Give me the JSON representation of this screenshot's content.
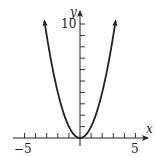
{
  "chart_data": {
    "type": "line",
    "title": "",
    "function": "y = x^2",
    "xlabel": "x",
    "ylabel": "y",
    "xlim": [
      -5.5,
      6
    ],
    "ylim": [
      -0.6,
      11
    ],
    "x_tick_step": 1,
    "y_tick_step": 1,
    "x_tick_labels": [
      {
        "value": -5,
        "label": "−5"
      },
      {
        "value": 5,
        "label": "5"
      }
    ],
    "y_tick_labels": [
      {
        "value": 10,
        "label": "10"
      }
    ],
    "grid": false,
    "legend": null,
    "series": [
      {
        "name": "y = x^2",
        "x": [
          -3.2,
          -3,
          -2.5,
          -2,
          -1.5,
          -1,
          -0.5,
          0,
          0.5,
          1,
          1.5,
          2,
          2.5,
          3,
          3.2
        ],
        "values": [
          10.24,
          9,
          6.25,
          4,
          2.25,
          1,
          0.25,
          0,
          0.25,
          1,
          2.25,
          4,
          6.25,
          9,
          10.24
        ],
        "arrows_at_ends": true
      }
    ],
    "color": "#222222"
  },
  "axes": {
    "x_label": "x",
    "y_label": "y",
    "x_min_label": "−5",
    "x_max_label": "5",
    "y_max_label": "10"
  }
}
